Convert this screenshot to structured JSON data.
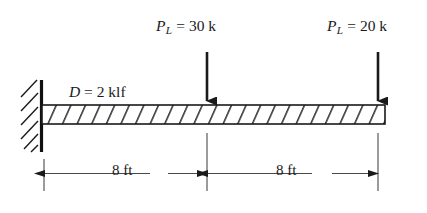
{
  "figure": {
    "type": "structural-beam-diagram",
    "colors": {
      "line": "#1a1a1a",
      "dimension_line": "#4a4a4a",
      "background": "#ffffff",
      "beam_fill": "#ffffff"
    }
  },
  "support": {
    "type": "fixed-support",
    "name": "wall",
    "hatch_count": 6
  },
  "beam": {
    "name": "beam-member",
    "hatch_pattern": "diagonal",
    "total_length_text": "16 ft"
  },
  "distributed_load": {
    "symbol": "D",
    "equals": "=",
    "magnitude": "2",
    "unit": "klf",
    "full_text": "D = 2 klf"
  },
  "point_loads": [
    {
      "symbol": "P",
      "subscript": "L",
      "equals": "=",
      "magnitude": "30",
      "unit": "k",
      "full_text": "PL = 30 k",
      "position_label": "midspan",
      "direction": "down"
    },
    {
      "symbol": "P",
      "subscript": "L",
      "equals": "=",
      "magnitude": "20",
      "unit": "k",
      "full_text": "PL = 20 k",
      "position_label": "free-end",
      "direction": "down"
    }
  ],
  "dimensions": [
    {
      "value": "8",
      "unit": "ft",
      "full_text": "8 ft",
      "segment": "support-to-midspan"
    },
    {
      "value": "8",
      "unit": "ft",
      "full_text": "8 ft",
      "segment": "midspan-to-free-end"
    }
  ]
}
